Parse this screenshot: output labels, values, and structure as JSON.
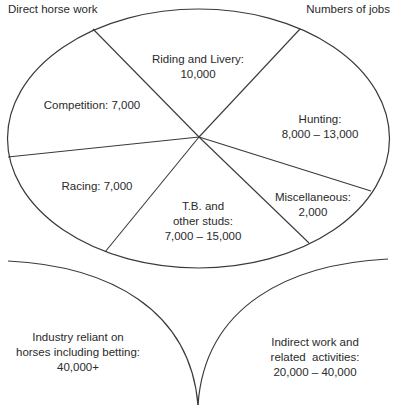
{
  "header": {
    "left_title": "Direct horse work",
    "right_title": "Numbers of jobs"
  },
  "segments": [
    {
      "id": "riding-livery",
      "lines": [
        "Riding and Livery:",
        "10,000"
      ]
    },
    {
      "id": "hunting",
      "lines": [
        "Hunting:",
        "8,000 – 13,000"
      ]
    },
    {
      "id": "miscellaneous",
      "lines": [
        "Miscellaneous:",
        "2,000"
      ]
    },
    {
      "id": "studs",
      "lines": [
        "T.B. and",
        "other studs:",
        "7,000 – 15,000"
      ]
    },
    {
      "id": "racing",
      "lines": [
        "Racing: 7,000"
      ]
    },
    {
      "id": "competition",
      "lines": [
        "Competition: 7,000"
      ]
    }
  ],
  "lower": {
    "left": {
      "lines": [
        "Industry reliant on",
        "horses including betting:",
        "40,000+"
      ]
    },
    "right": {
      "lines": [
        "Indirect work and",
        "related  activities:",
        "20,000 – 40,000"
      ]
    }
  },
  "colors": {
    "stroke": "#3a3a3a",
    "text": "#2a2a2a",
    "background": "#ffffff"
  }
}
